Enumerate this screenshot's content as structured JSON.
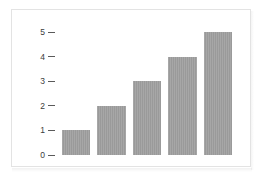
{
  "figure": {
    "frame_border_color": "#e3e3e3",
    "background_color": "#ffffff"
  },
  "chart_data": {
    "type": "bar",
    "title": "",
    "subtitle": "",
    "xlabel": "",
    "ylabel": "",
    "categories": [
      "",
      "",
      "",
      "",
      ""
    ],
    "values": [
      1,
      2,
      3,
      4,
      5
    ],
    "ylim": [
      0,
      5
    ],
    "yticks": [
      0,
      1,
      2,
      3,
      4,
      5
    ],
    "ytick_labels": [
      "0",
      "1",
      "2",
      "3",
      "4",
      "5"
    ],
    "xticks": [],
    "xtick_labels": [],
    "grid": false,
    "legend": null,
    "bar_color": "#9a9a9a",
    "bar_edge_color": "#9a9a9a",
    "tick_color": "#5a5a5a",
    "tick_label_color": "#3b3b3b",
    "annotations": []
  }
}
